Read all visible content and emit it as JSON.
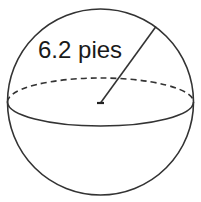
{
  "diagram": {
    "type": "sphere",
    "radius_label": "6.2 pies",
    "radius_value": 6.2,
    "radius_unit": "pies",
    "stroke_color": "#333333",
    "equator": {
      "front_style": "solid",
      "back_style": "dashed"
    },
    "center_marker": true
  }
}
